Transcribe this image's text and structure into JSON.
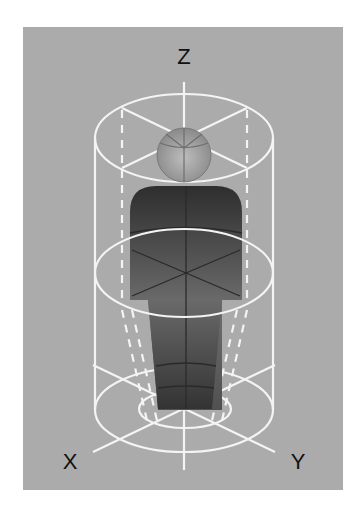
{
  "diagram": {
    "axes": {
      "z": "Z",
      "x": "X",
      "y": "Y"
    },
    "colors": {
      "background": "#ababab",
      "lines": "#f4f4f4",
      "body_dark": "#2f2f2f",
      "body_light": "#777777",
      "head": "#9a9a9a",
      "label": "#111111"
    },
    "elements": [
      "cylinder",
      "top-ellipse",
      "middle-ellipse",
      "bottom-ellipse",
      "inner-ellipse",
      "head-sphere",
      "torso",
      "legs",
      "z-axis",
      "x-axis",
      "y-axis"
    ]
  }
}
